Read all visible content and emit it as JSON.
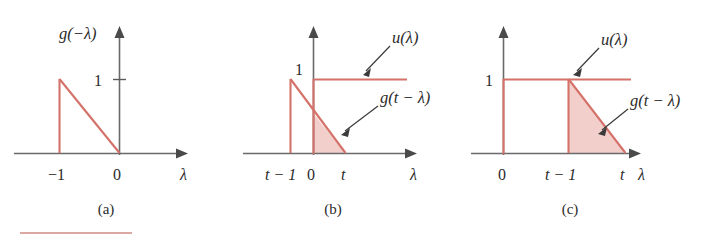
{
  "figure": {
    "accent_color": "#d4726a",
    "shade_color": "#e8a8a0",
    "axis_color": "#6a6a6a",
    "text_color": "#2b2b2b"
  },
  "panels": [
    {
      "id": "a",
      "caption": "(a)",
      "y_axis_label": "g(−λ)",
      "x_axis_label": "λ",
      "y_tick_label": "1",
      "x_tick_labels": [
        "−1",
        "0"
      ],
      "functions": [
        {
          "name": "g(−λ)",
          "shape": "ramp-down-triangle",
          "support": [
            -1,
            0
          ],
          "peak": 1
        }
      ],
      "shaded": false
    },
    {
      "id": "b",
      "caption": "(b)",
      "x_axis_label": "λ",
      "y_tick_label": "1",
      "x_tick_labels": [
        "t − 1",
        "0",
        "t"
      ],
      "annotations": [
        {
          "label": "u(λ)",
          "target": "step-function"
        },
        {
          "label": "g(t − λ)",
          "target": "shifted-ramp"
        }
      ],
      "functions": [
        {
          "name": "u(λ)",
          "shape": "unit-step",
          "onset": 0,
          "level": 1
        },
        {
          "name": "g(t − λ)",
          "shape": "ramp-down-triangle",
          "support": [
            "t-1",
            "t"
          ],
          "peak": 1
        }
      ],
      "shaded": true,
      "shaded_region": "overlap from 0 to t"
    },
    {
      "id": "c",
      "caption": "(c)",
      "x_axis_label": "λ",
      "y_tick_label": "1",
      "x_tick_labels": [
        "0",
        "t − 1",
        "t"
      ],
      "annotations": [
        {
          "label": "u(λ)",
          "target": "step-function"
        },
        {
          "label": "g(t − λ)",
          "target": "shifted-ramp"
        }
      ],
      "functions": [
        {
          "name": "u(λ)",
          "shape": "unit-step",
          "onset": 0,
          "level": 1
        },
        {
          "name": "g(t − λ)",
          "shape": "ramp-down-triangle",
          "support": [
            "t-1",
            "t"
          ],
          "peak": 1
        }
      ],
      "shaded": true,
      "shaded_region": "overlap from t-1 to t"
    }
  ]
}
